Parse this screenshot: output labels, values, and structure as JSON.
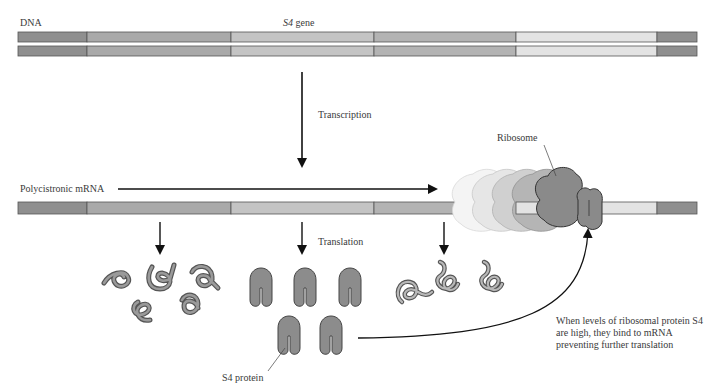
{
  "labels": {
    "dna": "DNA",
    "gene_italic": "S4",
    "gene_rest": " gene",
    "transcription": "Transcription",
    "polycistronic_mrna": "Polycistronic mRNA",
    "ribosome": "Ribosome",
    "translation": "Translation",
    "s4_protein": "S4 protein",
    "feedback_note": "When levels of ribosomal protein S4 are high, they bind to mRNA preventing further translation"
  },
  "colors": {
    "seg_dark": "#8f8f8f",
    "seg_mid": "#a9a9a9",
    "seg_light": "#c4c4c4",
    "seg_lightest": "#e3e3e3",
    "outline": "#555555",
    "protein_fill": "#8c8c8c",
    "arrow": "#111111"
  },
  "strand_segments": [
    {
      "x": 18,
      "w": 69,
      "shade": "seg_dark"
    },
    {
      "x": 87,
      "w": 144,
      "shade": "seg_mid"
    },
    {
      "x": 231,
      "w": 143,
      "shade": "seg_light"
    },
    {
      "x": 374,
      "w": 142,
      "shade": "seg_mid"
    },
    {
      "x": 516,
      "w": 141,
      "shade": "seg_lightest"
    },
    {
      "x": 657,
      "w": 40,
      "shade": "seg_dark"
    }
  ]
}
